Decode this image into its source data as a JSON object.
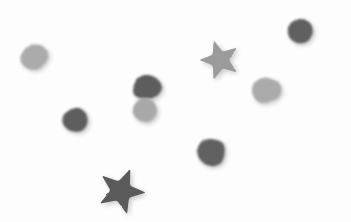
{
  "image": {
    "title": "Gray geometric shapes on white background",
    "width": 351,
    "height": 222,
    "background_color": "#fefefe",
    "description": "Scanned sheet showing nine scattered gray shapes: seven rounded blobs/polygons and two five-pointed stars, printed in two gray tones with soft textured edges.",
    "shape_count": "9",
    "star_count": "2",
    "blob_count": "7"
  },
  "palette": {
    "dark_gray": "#5c5c5c",
    "dark_gray_alt": "#636363",
    "light_gray": "#a9a9a9",
    "light_gray_alt": "#b0b0b0",
    "mid_gray": "#9a9a9a",
    "background": "#fefefe",
    "shadow": "#d8d8d8"
  },
  "shapes": [
    {
      "id": "blob-light-upper-left",
      "label": "Light gray rounded blob",
      "kind": "blob",
      "tone": "light",
      "color": "#ababab",
      "cx": 34,
      "cy": 57,
      "rx": 15,
      "ry": 14,
      "rotation": -12
    },
    {
      "id": "blob-dark-upper-right",
      "label": "Dark gray rounded blob",
      "kind": "blob",
      "tone": "dark",
      "color": "#5f5f5f",
      "cx": 300,
      "cy": 31,
      "rx": 14,
      "ry": 14,
      "rotation": 18
    },
    {
      "id": "star-mid-gray-top",
      "label": "Medium gray five-pointed star",
      "kind": "star",
      "tone": "mid",
      "color": "#9b9b9b",
      "cx": 220,
      "cy": 60,
      "rx": 21,
      "ry": 21,
      "rotation": -18
    },
    {
      "id": "blob-dark-center",
      "label": "Dark gray rounded blob",
      "kind": "blob",
      "tone": "dark",
      "color": "#5b5b5b",
      "cx": 147,
      "cy": 87,
      "rx": 16,
      "ry": 14,
      "rotation": 8
    },
    {
      "id": "blob-light-center",
      "label": "Light gray rounded blob overlapping dark blob",
      "kind": "blob",
      "tone": "light",
      "color": "#a8a8a8",
      "cx": 145,
      "cy": 109,
      "rx": 13,
      "ry": 13,
      "rotation": -20
    },
    {
      "id": "blob-light-right",
      "label": "Light gray heptagon blob",
      "kind": "blob",
      "tone": "light",
      "color": "#ababab",
      "cx": 266,
      "cy": 90,
      "rx": 15,
      "ry": 14,
      "rotation": 25
    },
    {
      "id": "blob-dark-left",
      "label": "Dark gray rounded blob",
      "kind": "blob",
      "tone": "dark",
      "color": "#5d5d5d",
      "cx": 75,
      "cy": 120,
      "rx": 14,
      "ry": 13,
      "rotation": -30
    },
    {
      "id": "blob-dark-lower-center",
      "label": "Dark gray octagon blob",
      "kind": "blob",
      "tone": "dark",
      "color": "#606060",
      "cx": 211,
      "cy": 152,
      "rx": 16,
      "ry": 15,
      "rotation": 10
    },
    {
      "id": "star-dark-bottom",
      "label": "Dark gray five-pointed star",
      "kind": "star",
      "tone": "dark",
      "color": "#5a5a5a",
      "cx": 121,
      "cy": 191,
      "rx": 25,
      "ry": 24,
      "rotation": 22
    }
  ]
}
